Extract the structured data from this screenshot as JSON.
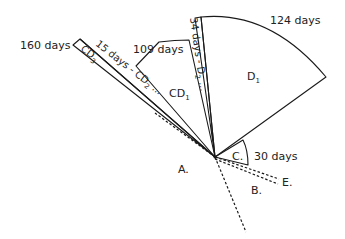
{
  "diagram": {
    "sectors": [
      {
        "id": "CD3",
        "label": "CD",
        "sub": "3",
        "duration": "160 days"
      },
      {
        "id": "CD2",
        "label": "15 days - CD",
        "sub": "2",
        "trail": " ..."
      },
      {
        "id": "CD1",
        "label": "CD",
        "sub": "1",
        "duration": "109 days"
      },
      {
        "id": "D2",
        "label": "34 days - D",
        "sub": "2",
        "trail": " ..."
      },
      {
        "id": "D1",
        "label": "D",
        "sub": "1",
        "duration": "124 days"
      },
      {
        "id": "C",
        "label": "C.",
        "duration": "30 days"
      }
    ],
    "directions": [
      {
        "id": "A",
        "label": "A."
      },
      {
        "id": "B",
        "label": "B."
      },
      {
        "id": "E",
        "label": "E."
      }
    ]
  }
}
